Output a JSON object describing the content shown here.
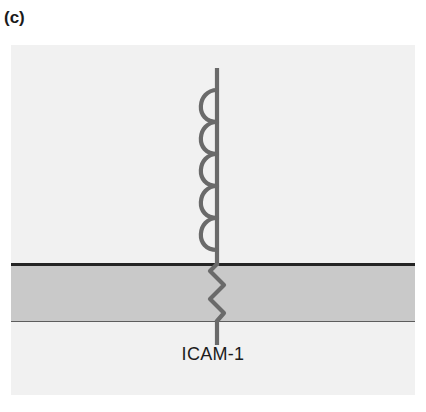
{
  "figure": {
    "panel_letter": "(c)",
    "protein_label": "ICAM-1",
    "colors": {
      "background": "#ffffff",
      "plate_background": "#f1f1f1",
      "membrane_fill": "#c9c9c9",
      "membrane_top_border": "#242424",
      "membrane_bottom_border": "#5d5d5d",
      "protein_stroke": "#6a6a6a",
      "text": "#1a1a1a"
    },
    "structure": {
      "domain_count": 5,
      "domain_type": "immunoglobulin-like loop",
      "domain_side": "left",
      "stem_description": "vertical extracellular stalk",
      "transmembrane_description": "zigzag transmembrane segment",
      "transmembrane_turns": 4,
      "cytoplasmic_tail_description": "short straight intracellular tail"
    }
  }
}
